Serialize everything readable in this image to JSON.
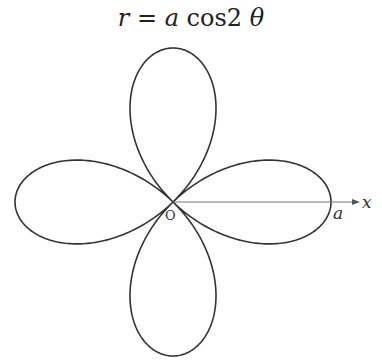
{
  "title": {
    "r": "r",
    "eq": " = ",
    "a": "a",
    "cos": " cos2 ",
    "theta": "θ"
  },
  "diagram": {
    "type": "polar-rose",
    "equation": "r = a cos2 θ",
    "petals": 4,
    "origin_label": "O",
    "axis_label": "x",
    "tip_label": "a",
    "colors": {
      "curve": "#333333",
      "axis": "#666666",
      "text": "#222222"
    }
  }
}
